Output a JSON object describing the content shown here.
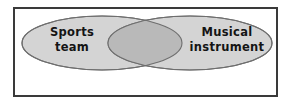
{
  "diagram": {
    "type": "venn",
    "kind": "two-set-venn-diagram",
    "sets": [
      {
        "id": "left",
        "label_line1": "Sports",
        "label_line2": "team",
        "fill": "#d4d4d4",
        "stroke": "#6e6e6e"
      },
      {
        "id": "right",
        "label_line1": "Musical",
        "label_line2": "instrument",
        "fill": "#d4d4d4",
        "stroke": "#6e6e6e"
      }
    ],
    "intersection": {
      "label": "",
      "fill": "#b9b9b9",
      "stroke": "#6e6e6e"
    },
    "frame": {
      "border_color": "#3a3a3a",
      "background": "#ffffff"
    },
    "page": {
      "background": "#ffffff"
    }
  }
}
